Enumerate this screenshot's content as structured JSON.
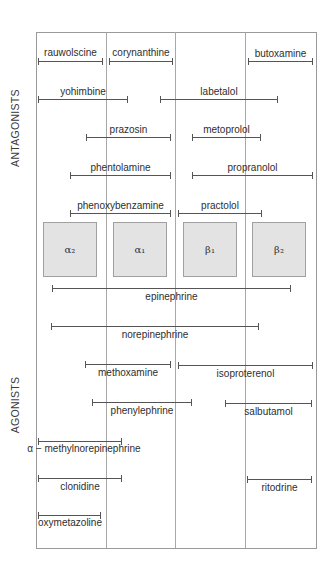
{
  "diagram": {
    "section_labels": {
      "antagonists": "ANTAGONISTS",
      "agonists": "AGONISTS"
    },
    "frame": {
      "left": 36,
      "top": 32,
      "right": 316,
      "bottom": 548
    },
    "column_dividers_x": [
      106,
      175,
      245
    ],
    "receptors": [
      {
        "id": "alpha2",
        "label": "α₂",
        "x": 43
      },
      {
        "id": "alpha1",
        "label": "α₁",
        "x": 113
      },
      {
        "id": "beta1",
        "label": "β₁",
        "x": 183
      },
      {
        "id": "beta2",
        "label": "β₂",
        "x": 252
      }
    ],
    "receptor_box_top": 222,
    "antagonists": [
      {
        "name": "rauwolscine",
        "x1": 38,
        "x2": 103,
        "y": 61,
        "label_y": 48
      },
      {
        "name": "corynanthine",
        "x1": 109,
        "x2": 173,
        "y": 61,
        "label_y": 48
      },
      {
        "name": "butoxamine",
        "x1": 248,
        "x2": 313,
        "y": 61,
        "label_y": 49
      },
      {
        "name": "yohimbine",
        "x1": 38,
        "x2": 128,
        "y": 99,
        "label_y": 87
      },
      {
        "name": "labetalol",
        "x1": 160,
        "x2": 278,
        "y": 99,
        "label_y": 87
      },
      {
        "name": "prazosin",
        "x1": 86,
        "x2": 171,
        "y": 137,
        "label_y": 125
      },
      {
        "name": "metoprolol",
        "x1": 192,
        "x2": 261,
        "y": 137,
        "label_y": 125
      },
      {
        "name": "phentolamine",
        "x1": 70,
        "x2": 171,
        "y": 175,
        "label_y": 163
      },
      {
        "name": "propranolol",
        "x1": 192,
        "x2": 313,
        "y": 175,
        "label_y": 163
      },
      {
        "name": "phenoxybenzamine",
        "x1": 70,
        "x2": 171,
        "y": 213,
        "label_y": 201
      },
      {
        "name": "practolol",
        "x1": 178,
        "x2": 262,
        "y": 213,
        "label_y": 201
      }
    ],
    "agonists": [
      {
        "name": "epinephrine",
        "x1": 52,
        "x2": 291,
        "y": 288,
        "label_y": 292
      },
      {
        "name": "norepinephrine",
        "x1": 51,
        "x2": 259,
        "y": 326,
        "label_y": 330
      },
      {
        "name": "methoxamine",
        "x1": 85,
        "x2": 171,
        "y": 364,
        "label_y": 368
      },
      {
        "name": "isoproterenol",
        "x1": 178,
        "x2": 313,
        "y": 365,
        "label_y": 369
      },
      {
        "name": "phenylephrine",
        "x1": 92,
        "x2": 192,
        "y": 402,
        "label_y": 406
      },
      {
        "name": "salbutamol",
        "x1": 225,
        "x2": 312,
        "y": 403,
        "label_y": 407
      },
      {
        "name": "α − methylnorepinephrine",
        "x1": 38,
        "x2": 122,
        "y": 441,
        "label_y": 444
      },
      {
        "name": "clonidine",
        "x1": 38,
        "x2": 122,
        "y": 478,
        "label_y": 482
      },
      {
        "name": "ritodrine",
        "x1": 247,
        "x2": 312,
        "y": 479,
        "label_y": 483
      },
      {
        "name": "oxymetazoline",
        "x1": 38,
        "x2": 101,
        "y": 515,
        "label_y": 518
      }
    ],
    "colors": {
      "receptor_fill": "#e3e3e3",
      "line": "#555555",
      "frame": "#9a9a9a"
    }
  }
}
